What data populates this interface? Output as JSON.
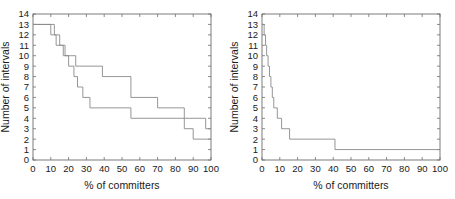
{
  "figure": {
    "title": "",
    "background_color": "#ffffff",
    "line_color": "#8a8a8a",
    "axis_color": "#6e6e6e",
    "panel_count": 2
  },
  "chart_data": [
    {
      "type": "line",
      "title": "",
      "subtitle": "",
      "xlabel": "% of committers",
      "ylabel": "Number of intervals",
      "xlim": [
        0,
        100
      ],
      "ylim": [
        0,
        14
      ],
      "xticks": [
        0,
        10,
        20,
        30,
        40,
        50,
        60,
        70,
        80,
        90,
        100
      ],
      "yticks": [
        0,
        1,
        2,
        3,
        4,
        5,
        6,
        7,
        8,
        9,
        10,
        11,
        12,
        13,
        14
      ],
      "xticklabels": [
        "0",
        "10",
        "20",
        "30",
        "40",
        "50",
        "60",
        "70",
        "80",
        "90",
        "100"
      ],
      "yticklabels": [
        "0",
        "1",
        "2",
        "3",
        "4",
        "5",
        "6",
        "7",
        "8",
        "9",
        "10",
        "11",
        "12",
        "13",
        "14"
      ],
      "grid": false,
      "legend": "none",
      "drawstyle": "steps-post",
      "series": [
        {
          "name": "upper staircase",
          "x": [
            0,
            12,
            12,
            15,
            15,
            18,
            18,
            21,
            21,
            24,
            24,
            26,
            26,
            39,
            39,
            55,
            55,
            70,
            70,
            85,
            85,
            97,
            97,
            100
          ],
          "y": [
            13,
            13,
            12,
            12,
            11,
            11,
            10,
            10,
            10,
            10,
            9,
            9,
            9,
            9,
            8,
            8,
            6,
            6,
            5,
            5,
            4,
            4,
            3,
            3
          ]
        },
        {
          "name": "lower staircase",
          "x": [
            0,
            10,
            10,
            13,
            13,
            17,
            17,
            20,
            20,
            23,
            23,
            25,
            25,
            28,
            28,
            32,
            32,
            39,
            39,
            55,
            55,
            85,
            85,
            90,
            90,
            97,
            97,
            100
          ],
          "y": [
            13,
            13,
            12,
            12,
            11,
            11,
            10,
            10,
            9,
            9,
            8,
            8,
            7,
            7,
            6,
            6,
            5,
            5,
            5,
            5,
            4,
            4,
            3,
            3,
            2,
            2,
            2,
            2
          ]
        }
      ]
    },
    {
      "type": "line",
      "title": "",
      "subtitle": "",
      "xlabel": "% of committers",
      "ylabel": "Number of intervals",
      "xlim": [
        0,
        100
      ],
      "ylim": [
        0,
        14
      ],
      "xticks": [
        0,
        10,
        20,
        30,
        40,
        50,
        60,
        70,
        80,
        90,
        100
      ],
      "yticks": [
        0,
        1,
        2,
        3,
        4,
        5,
        6,
        7,
        8,
        9,
        10,
        11,
        12,
        13,
        14
      ],
      "xticklabels": [
        "0",
        "10",
        "20",
        "30",
        "40",
        "50",
        "60",
        "70",
        "80",
        "90",
        "100"
      ],
      "yticklabels": [
        "0",
        "1",
        "2",
        "3",
        "4",
        "5",
        "6",
        "7",
        "8",
        "9",
        "10",
        "11",
        "12",
        "13",
        "14"
      ],
      "grid": false,
      "legend": "none",
      "drawstyle": "steps-post",
      "series": [
        {
          "name": "interval decay",
          "x": [
            0,
            1.2,
            1.2,
            2.0,
            2.0,
            2.6,
            2.6,
            3.4,
            3.4,
            4.2,
            4.2,
            5.0,
            5.0,
            5.8,
            5.8,
            6.6,
            6.6,
            7.6,
            7.6,
            8.6,
            8.6,
            9.6,
            9.6,
            11.0,
            11.0,
            13.0,
            13.0,
            15.5,
            15.5,
            23.0,
            23.0,
            41.0,
            41.0,
            100
          ],
          "y": [
            13,
            13,
            12,
            12,
            11,
            11,
            10,
            10,
            9,
            9,
            8,
            8,
            7,
            7,
            6,
            6,
            5,
            5,
            5,
            5,
            4,
            4,
            4,
            4,
            3,
            3,
            3,
            3,
            2,
            2,
            2,
            2,
            1,
            1
          ]
        }
      ]
    }
  ]
}
